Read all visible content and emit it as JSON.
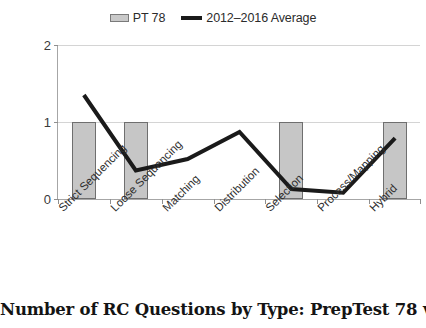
{
  "chart_data": {
    "type": "bar",
    "title": "Number of RC Questions by Type: PrepTest 78 vs. 2012–2016 Average",
    "xlabel": "",
    "ylabel": "",
    "ylim": [
      0,
      2
    ],
    "yticks": [
      0,
      1,
      2
    ],
    "ytick_labels": [
      "0",
      "1",
      "2"
    ],
    "grid": true,
    "legend_position": "top-center",
    "categories": [
      "Strict Sequencing",
      "Loose Sequencing",
      "Matching",
      "Distribution",
      "Selection",
      "Process/Mapping",
      "Hybrid"
    ],
    "series": [
      {
        "name": "PT 78",
        "type": "bar",
        "color": "#c6c6c6",
        "edge_color": "#6f6f6f",
        "values": [
          1,
          1,
          0,
          0,
          1,
          0,
          1
        ]
      },
      {
        "name": "2012–2016 Average",
        "type": "line",
        "color": "#1a1a1a",
        "values": [
          1.35,
          0.37,
          0.52,
          0.87,
          0.13,
          0.08,
          0.79
        ]
      }
    ]
  },
  "legend": {
    "entries": [
      {
        "label": "PT 78",
        "marker": "bar-swatch"
      },
      {
        "label": "2012–2016 Average",
        "marker": "line-swatch"
      }
    ]
  },
  "caption": {
    "text": "Number of RC Questions by Type: PrepTest 78 vs. 2012–2016 Average"
  },
  "colors": {
    "bar_fill": "#c6c6c6",
    "bar_edge": "#6f6f6f",
    "line": "#1a1a1a",
    "gridline": "#d4d4d4",
    "axis": "#a6a6a6",
    "text": "#231f20",
    "background": "#ffffff"
  }
}
